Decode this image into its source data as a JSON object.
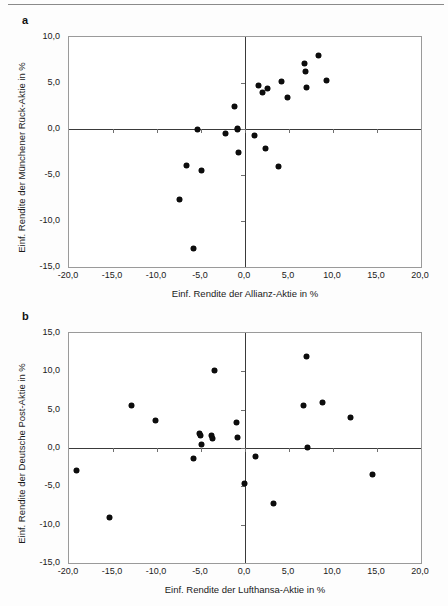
{
  "figure": {
    "background": "#fdfdfd",
    "point_color": "#0d0d0d",
    "axis_color": "#3a3a3a",
    "frame_color": "#9a9a9a"
  },
  "panels": {
    "a": {
      "letter": "a"
    },
    "b": {
      "letter": "b"
    }
  },
  "chart_data": [
    {
      "type": "scatter",
      "panel": "a",
      "title": "",
      "xlabel": "Einf. Rendite der Allianz-Aktie  in %",
      "ylabel": "Einf. Rendite der Münchener Rück-Aktie in %",
      "xlim": [
        -20.0,
        20.0
      ],
      "ylim": [
        -15.0,
        10.0
      ],
      "xticks": [
        -20.0,
        -15.0,
        -10.0,
        -5.0,
        0.0,
        5.0,
        10.0,
        15.0,
        20.0
      ],
      "yticks": [
        10.0,
        5.0,
        0.0,
        -5.0,
        -10.0,
        -15.0
      ],
      "xticklabels": [
        "-20,0",
        "-15,0",
        "-10,0",
        "-5,0",
        "0,0",
        "5,0",
        "10,0",
        "15,0",
        "20,0"
      ],
      "yticklabels": [
        "10,0",
        "5,0",
        "0,0",
        "-5,0",
        "-10,0",
        "-15,0"
      ],
      "grid": false,
      "legend": "none",
      "points": [
        [
          -7.4,
          -7.7
        ],
        [
          -6.6,
          -4.0
        ],
        [
          -5.8,
          -13.0
        ],
        [
          -5.4,
          -0.1
        ],
        [
          -5.0,
          -4.5
        ],
        [
          -2.2,
          -0.5
        ],
        [
          -1.2,
          2.4
        ],
        [
          -0.9,
          0.1
        ],
        [
          -0.8,
          0.0
        ],
        [
          -0.7,
          -2.5
        ],
        [
          1.1,
          -0.7
        ],
        [
          1.5,
          4.7
        ],
        [
          2.0,
          4.0
        ],
        [
          2.6,
          4.4
        ],
        [
          2.3,
          -2.1
        ],
        [
          3.8,
          -4.1
        ],
        [
          4.1,
          5.2
        ],
        [
          4.8,
          3.4
        ],
        [
          6.8,
          7.1
        ],
        [
          6.9,
          6.2
        ],
        [
          7.0,
          4.5
        ],
        [
          8.4,
          8.0
        ],
        [
          9.3,
          5.3
        ]
      ]
    },
    {
      "type": "scatter",
      "panel": "b",
      "title": "",
      "xlabel": "Einf. Rendite der Lufthansa-Aktie in %",
      "ylabel": "Einf. Rendite der Deutsche Post-Aktie in %",
      "xlim": [
        -20.0,
        20.0
      ],
      "ylim": [
        -15.0,
        15.0
      ],
      "xticks": [
        -20.0,
        -15.0,
        -10.0,
        -5.0,
        0.0,
        5.0,
        10.0,
        15.0,
        20.0
      ],
      "yticks": [
        15.0,
        10.0,
        5.0,
        0.0,
        -5.0,
        -10.0,
        -15.0
      ],
      "xticklabels": [
        "-20,0",
        "-15,0",
        "-10,0",
        "-5,0",
        "0,0",
        "5,0",
        "10,0",
        "15,0",
        "20,0"
      ],
      "yticklabels": [
        "15,0",
        "10,0",
        "5,0",
        "0,0",
        "-5,0",
        "-10,0",
        "-15,0"
      ],
      "grid": false,
      "legend": "none",
      "points": [
        [
          -19.1,
          -2.9
        ],
        [
          -15.4,
          -9.0
        ],
        [
          -12.9,
          5.6
        ],
        [
          -10.2,
          3.6
        ],
        [
          -5.9,
          -1.4
        ],
        [
          -5.2,
          1.9
        ],
        [
          -5.1,
          1.6
        ],
        [
          -5.0,
          0.5
        ],
        [
          -3.8,
          1.6
        ],
        [
          -3.7,
          1.2
        ],
        [
          -3.5,
          10.1
        ],
        [
          -1.0,
          3.3
        ],
        [
          -0.9,
          1.4
        ],
        [
          -0.1,
          -4.6
        ],
        [
          1.2,
          -1.1
        ],
        [
          3.2,
          -7.3
        ],
        [
          6.6,
          5.6
        ],
        [
          7.0,
          12.0
        ],
        [
          7.1,
          0.1
        ],
        [
          8.8,
          6.0
        ],
        [
          12.0,
          4.0
        ],
        [
          14.5,
          -3.5
        ]
      ]
    }
  ]
}
